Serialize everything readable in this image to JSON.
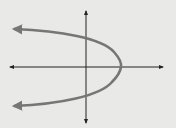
{
  "figure": {
    "title": "Graph of a parabola opening to the left"
  },
  "colors": {
    "background": "#e9e9e8",
    "axes": "#222222",
    "curve": "#767676"
  },
  "axes": {
    "x_axis": {
      "y": 67,
      "from": 8,
      "to": 164,
      "arrows": "both"
    },
    "y_axis": {
      "x": 86,
      "from": 10,
      "to": 124,
      "arrows": "both"
    }
  },
  "curve": {
    "type": "parabola",
    "opens": "left",
    "vertex": {
      "x": 121,
      "y": 67
    },
    "y_intercepts_px": [
      41,
      94
    ],
    "endpoints_px": [
      {
        "x": 12,
        "y": 29
      },
      {
        "x": 12,
        "y": 106
      }
    ],
    "arrows": "both ends"
  }
}
